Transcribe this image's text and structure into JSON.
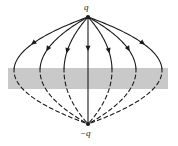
{
  "figure": {
    "labels": {
      "top_charge": "q",
      "bottom_charge": "−q"
    },
    "colors": {
      "line": "#1a1a1a",
      "band_fill": "#c9c9c9",
      "background": "#ffffff",
      "label": "#1a1a1a"
    },
    "geometry": {
      "top_charge_point": [
        88,
        17
      ],
      "bottom_charge_point": [
        88,
        124
      ],
      "band_x": 8,
      "band_y": 68,
      "band_width": 160,
      "band_height": 21,
      "dash_pattern": "4 3"
    }
  },
  "chart_data": {
    "type": "line",
    "xlabel": "",
    "ylabel": "",
    "xlim": [
      0,
      178
    ],
    "ylim": [
      0,
      146
    ],
    "grid": false,
    "legend": null,
    "annotations": [
      {
        "text": "q",
        "x": 88,
        "y": 10,
        "role": "positive-charge-label"
      },
      {
        "text": "−q",
        "x": 88,
        "y": 133,
        "role": "negative-charge-label"
      }
    ],
    "series": [
      {
        "name": "field-line-axis",
        "style": "solid",
        "bulge": 0,
        "arrow_at": 0.32
      },
      {
        "name": "field-line-left-1",
        "style": "solid-upper-dashed-lower",
        "bulge": -24,
        "arrow_at": 0.34
      },
      {
        "name": "field-line-left-2",
        "style": "solid-upper-dashed-lower",
        "bulge": -48,
        "arrow_at": 0.32
      },
      {
        "name": "field-line-left-3",
        "style": "solid-upper-dashed-lower",
        "bulge": -74,
        "arrow_at": 0.26
      },
      {
        "name": "field-line-right-1",
        "style": "solid-upper-dashed-lower",
        "bulge": 24,
        "arrow_at": 0.34
      },
      {
        "name": "field-line-right-2",
        "style": "solid-upper-dashed-lower",
        "bulge": 48,
        "arrow_at": 0.32
      },
      {
        "name": "field-line-right-3",
        "style": "solid-upper-dashed-lower",
        "bulge": 74,
        "arrow_at": 0.26
      }
    ]
  }
}
